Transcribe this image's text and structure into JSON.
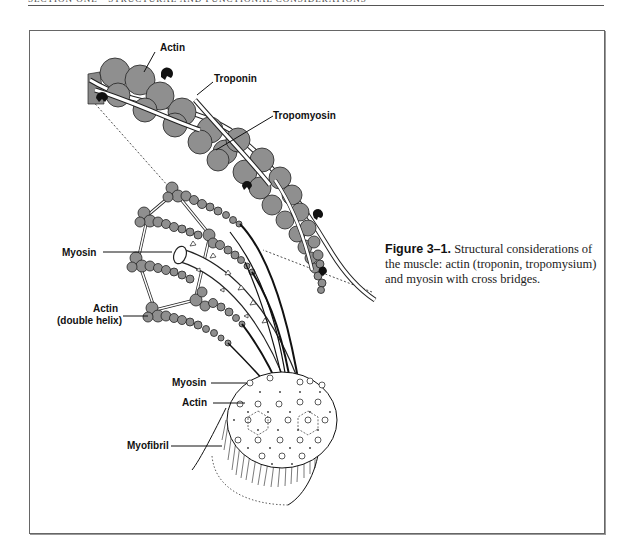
{
  "page": {
    "running_head": "SECTION ONE · STRUCTURAL AND FUNCTIONAL CONSIDERATIONS"
  },
  "figure": {
    "number": "Figure 3–1.",
    "caption": "Structural considerations of the muscle: actin (troponin, tropomysium) and myosin with cross bridges.",
    "labels": {
      "actin_top": "Actin",
      "troponin": "Troponin",
      "tropomyosin": "Tropomyosin",
      "myosin_left": "Myosin",
      "actin_double_1": "Actin",
      "actin_double_2": "(double helix)",
      "myosin_cross": "Myosin",
      "actin_cross": "Actin",
      "myofibril": "Myofibril"
    },
    "colors": {
      "globule_fill": "#8f8f8f",
      "line": "#111111",
      "border": "#666666"
    }
  }
}
